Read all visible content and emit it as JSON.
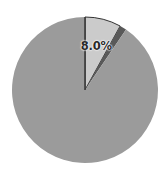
{
  "chart_data": {
    "type": "pie",
    "title": "",
    "start_angle_deg": 0,
    "direction": "clockwise",
    "slices": [
      {
        "name": "slice-1",
        "value": 8.0,
        "label": "8.0%",
        "color": "#cbcbcb"
      },
      {
        "name": "slice-2",
        "value": 1.5,
        "label": "",
        "color": "#595959"
      },
      {
        "name": "slice-3",
        "value": 90.5,
        "label": "",
        "color": "#9b9b9b"
      }
    ],
    "values": [
      8.0,
      1.5,
      90.5
    ],
    "labels": [
      "8.0%",
      "",
      ""
    ],
    "legend": [],
    "center": [
      85,
      90
    ],
    "radius": 73,
    "outline_color": "#333333"
  }
}
